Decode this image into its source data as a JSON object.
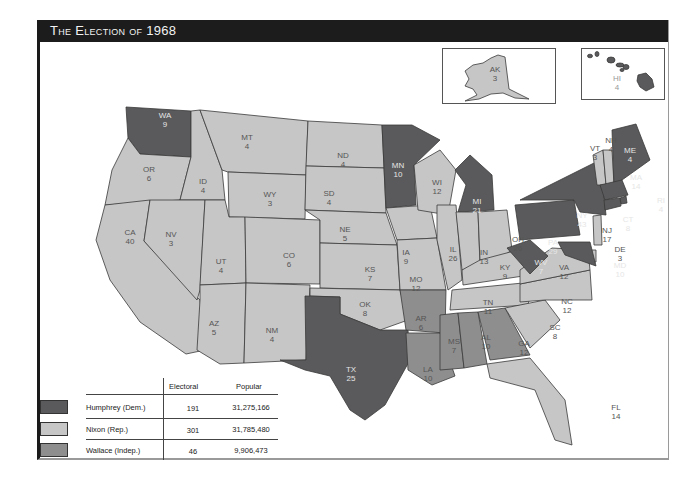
{
  "title": "The Election of 1968",
  "colors": {
    "humphrey": "#5a5a5c",
    "nixon": "#c6c6c6",
    "wallace": "#8e8e8e",
    "label_dark": "#e6e6e6",
    "label_light": "#555555",
    "water": "#7d7d7d"
  },
  "legend": {
    "headers": {
      "electoral": "Electoral",
      "popular": "Popular"
    },
    "rows": [
      {
        "candidate": "Humphrey (Dem.)",
        "electoral": "191",
        "popular": "31,275,166",
        "party": "humphrey"
      },
      {
        "candidate": "Nixon (Rep.)",
        "electoral": "301",
        "popular": "31,785,480",
        "party": "nixon"
      },
      {
        "candidate": "Wallace (Indep.)",
        "electoral": "46",
        "popular": "9,906,473",
        "party": "wallace"
      }
    ]
  },
  "insets": {
    "alaska": {
      "abbr": "AK",
      "votes": "3",
      "party": "nixon"
    },
    "hawaii": {
      "abbr": "HI",
      "votes": "4",
      "party": "humphrey"
    }
  },
  "states": {
    "WA": {
      "abbr": "WA",
      "votes": "9",
      "party": "humphrey"
    },
    "OR": {
      "abbr": "OR",
      "votes": "6",
      "party": "nixon"
    },
    "CA": {
      "abbr": "CA",
      "votes": "40",
      "party": "nixon"
    },
    "ID": {
      "abbr": "ID",
      "votes": "4",
      "party": "nixon"
    },
    "NV": {
      "abbr": "NV",
      "votes": "3",
      "party": "nixon"
    },
    "MT": {
      "abbr": "MT",
      "votes": "4",
      "party": "nixon"
    },
    "WY": {
      "abbr": "WY",
      "votes": "3",
      "party": "nixon"
    },
    "UT": {
      "abbr": "UT",
      "votes": "4",
      "party": "nixon"
    },
    "AZ": {
      "abbr": "AZ",
      "votes": "5",
      "party": "nixon"
    },
    "CO": {
      "abbr": "CO",
      "votes": "6",
      "party": "nixon"
    },
    "NM": {
      "abbr": "NM",
      "votes": "4",
      "party": "nixon"
    },
    "ND": {
      "abbr": "ND",
      "votes": "4",
      "party": "nixon"
    },
    "SD": {
      "abbr": "SD",
      "votes": "4",
      "party": "nixon"
    },
    "NE": {
      "abbr": "NE",
      "votes": "5",
      "party": "nixon"
    },
    "KS": {
      "abbr": "KS",
      "votes": "7",
      "party": "nixon"
    },
    "OK": {
      "abbr": "OK",
      "votes": "8",
      "party": "nixon"
    },
    "TX": {
      "abbr": "TX",
      "votes": "25",
      "party": "humphrey"
    },
    "MN": {
      "abbr": "MN",
      "votes": "10",
      "party": "humphrey"
    },
    "IA": {
      "abbr": "IA",
      "votes": "9",
      "party": "nixon"
    },
    "MO": {
      "abbr": "MO",
      "votes": "12",
      "party": "nixon"
    },
    "AR": {
      "abbr": "AR",
      "votes": "6",
      "party": "wallace"
    },
    "LA": {
      "abbr": "LA",
      "votes": "10",
      "party": "wallace"
    },
    "WI": {
      "abbr": "WI",
      "votes": "12",
      "party": "nixon"
    },
    "IL": {
      "abbr": "IL",
      "votes": "26",
      "party": "nixon"
    },
    "MI": {
      "abbr": "MI",
      "votes": "21",
      "party": "humphrey"
    },
    "IN": {
      "abbr": "IN",
      "votes": "13",
      "party": "nixon"
    },
    "OH": {
      "abbr": "OH",
      "votes": "26",
      "party": "nixon"
    },
    "KY": {
      "abbr": "KY",
      "votes": "9",
      "party": "nixon"
    },
    "TN": {
      "abbr": "TN",
      "votes": "11",
      "party": "nixon"
    },
    "MS": {
      "abbr": "MS",
      "votes": "7",
      "party": "wallace"
    },
    "AL": {
      "abbr": "AL",
      "votes": "10",
      "party": "wallace"
    },
    "GA": {
      "abbr": "GA",
      "votes": "12",
      "party": "wallace"
    },
    "FL": {
      "abbr": "FL",
      "votes": "14",
      "party": "nixon"
    },
    "SC": {
      "abbr": "SC",
      "votes": "8",
      "party": "nixon"
    },
    "NC": {
      "abbr": "NC",
      "votes": "12",
      "party": "nixon"
    },
    "VA": {
      "abbr": "VA",
      "votes": "12",
      "party": "nixon"
    },
    "WV": {
      "abbr": "WV",
      "votes": "7",
      "party": "humphrey"
    },
    "PA": {
      "abbr": "PA",
      "votes": "29",
      "party": "humphrey"
    },
    "NY": {
      "abbr": "NY",
      "votes": "43",
      "party": "humphrey"
    },
    "VT": {
      "abbr": "VT",
      "votes": "3",
      "party": "nixon"
    },
    "NH": {
      "abbr": "NH",
      "votes": "4",
      "party": "nixon"
    },
    "ME": {
      "abbr": "ME",
      "votes": "4",
      "party": "humphrey"
    },
    "MA": {
      "abbr": "MA",
      "votes": "14",
      "party": "humphrey"
    },
    "RI": {
      "abbr": "RI",
      "votes": "4",
      "party": "humphrey"
    },
    "CT": {
      "abbr": "CT",
      "votes": "8",
      "party": "humphrey"
    },
    "NJ": {
      "abbr": "NJ",
      "votes": "17",
      "party": "nixon"
    },
    "DE": {
      "abbr": "DE",
      "votes": "3",
      "party": "nixon"
    },
    "MD": {
      "abbr": "MD",
      "votes": "10",
      "party": "humphrey"
    }
  }
}
